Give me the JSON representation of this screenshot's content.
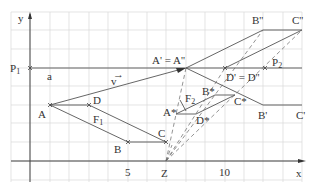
{
  "axes": {
    "x_label": "x",
    "y_label": "y",
    "tick_5": "5",
    "tick_10": "10"
  },
  "labels": {
    "P1": "P",
    "P1_sub": "1",
    "a": "a",
    "v": "v",
    "A": "A",
    "B": "B",
    "C": "C",
    "D": "D",
    "F1": "F",
    "F1_sub": "1",
    "F2": "F",
    "F2_sub": "2",
    "A_prime": "A' = A''",
    "D_prime": "D' = D''",
    "P2": "P",
    "P2_sub": "2",
    "B_dd": "B''",
    "C_dd": "C''",
    "B_p": "B'",
    "C_p": "C'",
    "A_star": "A*",
    "B_star": "B*",
    "C_star": "C*",
    "D_star": "D*",
    "Z": "Z"
  },
  "points": {
    "A": [
      2,
      3
    ],
    "B": [
      5,
      1
    ],
    "C": [
      7,
      1
    ],
    "D": [
      4,
      3
    ],
    "A_prime": [
      8,
      5
    ],
    "D_prime": [
      10,
      5
    ],
    "B_dd": [
      12,
      7
    ],
    "C_dd": [
      14,
      7
    ],
    "B_p": [
      12,
      3
    ],
    "C_p": [
      14,
      3
    ],
    "Z": [
      7,
      0
    ],
    "P1": [
      0,
      5
    ],
    "P2": [
      12,
      5
    ],
    "A_star": [
      7.5,
      2.5
    ],
    "B_star": [
      9.5,
      3.5
    ],
    "C_star": [
      10.5,
      3.5
    ],
    "D_star": [
      8.5,
      2.5
    ]
  }
}
